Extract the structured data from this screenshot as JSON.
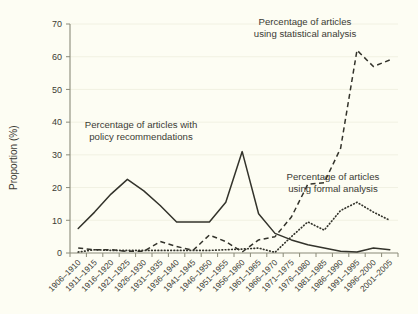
{
  "chart_data": {
    "type": "line",
    "title": "",
    "xlabel": "",
    "ylabel": "Proportion (%)",
    "ylim": [
      0,
      70
    ],
    "yticks": [
      0,
      10,
      20,
      30,
      40,
      50,
      60,
      70
    ],
    "ytick_labels": [
      "0",
      "10",
      "20",
      "30",
      "40",
      "50",
      "60",
      "70"
    ],
    "grid": true,
    "legend_position": "inline-annotations",
    "categories": [
      "1906–1910",
      "1911–1915",
      "1916–1920",
      "1921–1925",
      "1926–1930",
      "1931–1935",
      "1936–1940",
      "1941–1945",
      "1946–1950",
      "1951–1955",
      "1956–1960",
      "1961–1965",
      "1966–1970",
      "1971–1975",
      "1976–1980",
      "1981–1985",
      "1986–1990",
      "1991–1995",
      "1996–2000",
      "2001–2005"
    ],
    "series": [
      {
        "name": "Percentage of articles with policy recommendations",
        "style": "solid",
        "values": [
          7.5,
          12.5,
          18.0,
          22.5,
          19.0,
          14.5,
          9.5,
          9.5,
          9.5,
          15.5,
          31.0,
          12.0,
          6.0,
          4.0,
          2.5,
          1.5,
          0.5,
          0.3,
          1.5,
          1.0
        ]
      },
      {
        "name": "Percentage of articles using statistical analysis",
        "style": "dashed",
        "values": [
          1.5,
          1.0,
          1.0,
          0.5,
          0.5,
          3.5,
          2.0,
          0.8,
          5.5,
          3.5,
          0.3,
          4.0,
          5.0,
          11.0,
          21.0,
          21.5,
          32.0,
          62.0,
          57.0,
          59.0
        ]
      },
      {
        "name": "Percentage of articles using formal analysis",
        "style": "dotted",
        "values": [
          0.2,
          0.2,
          0.2,
          0.2,
          0.2,
          0.2,
          0.2,
          0.2,
          0.2,
          0.2,
          0.2,
          0.2,
          0.2,
          0.2,
          0.2,
          0.2,
          0.2,
          0.2,
          0.2,
          0.2
        ]
      }
    ],
    "series_detail_note": "Dashed series continues past 1991-1995 at 57, 48, 42; dotted series rises after 1966-1970.",
    "series_dashed_full": [
      1.5,
      1.0,
      1.0,
      0.5,
      0.5,
      3.5,
      2.0,
      0.8,
      5.5,
      3.5,
      0.3,
      4.0,
      5.0,
      11.0,
      21.0,
      21.5,
      32.0,
      62.0,
      57.0,
      59.0
    ],
    "series_dotted_full": [
      0.3,
      1.0,
      0.8,
      0.8,
      0.8,
      0.8,
      0.8,
      0.8,
      0.8,
      1.0,
      1.2,
      1.5,
      0.2,
      5.0,
      9.5,
      7.0,
      13.0,
      15.5,
      12.5,
      10.0
    ]
  },
  "annotations": [
    {
      "name": "policy-recommendations-label",
      "line1": "Percentage of articles with",
      "line2": "policy recommendations"
    },
    {
      "name": "statistical-analysis-label",
      "line1": "Percentage of articles",
      "line2": "using statistical analysis"
    },
    {
      "name": "formal-analysis-label",
      "line1": "Percentage of articles",
      "line2": "using formal analysis"
    }
  ],
  "colors": {
    "background": "#fdfdf3",
    "ink": "#33332b",
    "axis": "#8a8a78",
    "grid": "#f1f1e2"
  }
}
